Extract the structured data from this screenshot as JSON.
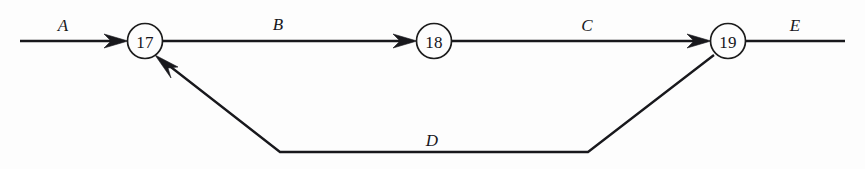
{
  "diagram": {
    "kind": "activity-network-diagram",
    "background_color": "#fdfdfd",
    "line_color": "#18181c",
    "text_color": "#17171b",
    "nodes": [
      {
        "id": "node-17",
        "label": "17",
        "cx": 145,
        "cy": 41,
        "r": 17.5
      },
      {
        "id": "node-18",
        "label": "18",
        "cx": 434,
        "cy": 41,
        "r": 17.5
      },
      {
        "id": "node-19",
        "label": "19",
        "cx": 728,
        "cy": 41,
        "r": 17.5
      }
    ],
    "edges": [
      {
        "id": "edge-a",
        "label": "A",
        "from": "entry",
        "to": "node-17",
        "label_x": 63,
        "label_y": 31,
        "arrow": true
      },
      {
        "id": "edge-b",
        "label": "B",
        "from": "node-17",
        "to": "node-18",
        "label_x": 278,
        "label_y": 30,
        "arrow": true
      },
      {
        "id": "edge-c",
        "label": "C",
        "from": "node-18",
        "to": "node-19",
        "label_x": 587,
        "label_y": 31,
        "arrow": true
      },
      {
        "id": "edge-d",
        "label": "D",
        "from": "node-19",
        "to": "node-17",
        "label_x": 432,
        "label_y": 146,
        "arrow": true,
        "shape": "trapezoid-feedback"
      },
      {
        "id": "edge-e",
        "label": "E",
        "from": "node-19",
        "to": "exit",
        "label_x": 795,
        "label_y": 31,
        "arrow": false
      }
    ]
  }
}
